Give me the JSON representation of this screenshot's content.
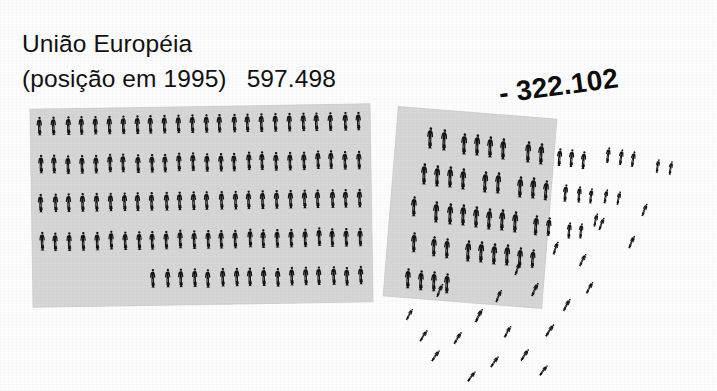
{
  "meta": {
    "image_kind": "scanned pictogram infographic",
    "background_color": "#fdfdfd",
    "panel_color": "#d6d6d6",
    "figure_color": "#141414"
  },
  "title": {
    "line1": "União Européia",
    "line2_label": "(posição em 1995)",
    "line2_value": "597.498"
  },
  "loss": {
    "label": "- 322.102"
  },
  "chart_data": {
    "type": "pictogram",
    "title": "União Européia (posição em 1995)",
    "xlabel": "",
    "ylabel": "",
    "grid": false,
    "legend_position": "none",
    "unit_note": "each human figure icon represents an equal share of the total",
    "categories": [
      "União Européia (posição em 1995)",
      "Perda"
    ],
    "values": [
      597498,
      -322102
    ],
    "value_labels": [
      "597.498",
      "- 322.102"
    ],
    "series": [
      {
        "name": "posição em 1995",
        "value": 597498,
        "value_label": "597.498",
        "panel": "main",
        "icon_layout": "dense grid, 5 rows",
        "rows": [
          {
            "row": 1,
            "count": 24,
            "align": "left"
          },
          {
            "row": 2,
            "count": 24,
            "align": "left"
          },
          {
            "row": 3,
            "count": 24,
            "align": "left"
          },
          {
            "row": 4,
            "count": 24,
            "align": "left"
          },
          {
            "row": 5,
            "count": 16,
            "align": "right"
          }
        ],
        "total_icons": 112
      },
      {
        "name": "perda",
        "value": -322102,
        "value_label": "- 322.102",
        "panel": "loss",
        "icon_layout": "irregular grid dispersing to scattered, rotated icons toward lower right",
        "rows": [
          {
            "row": 1,
            "count": 12
          },
          {
            "row": 2,
            "count": 12
          },
          {
            "row": 3,
            "count": 13
          },
          {
            "row": 4,
            "count": 11
          },
          {
            "row": 5,
            "count": 4
          }
        ],
        "scattered_icons": 22,
        "total_icons": 74
      }
    ]
  }
}
